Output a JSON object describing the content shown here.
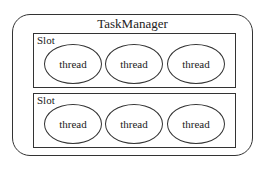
{
  "diagram": {
    "container": {
      "label": "TaskManager",
      "slots": [
        {
          "label": "Slot",
          "threads": [
            {
              "label": "thread"
            },
            {
              "label": "thread"
            },
            {
              "label": "thread"
            }
          ]
        },
        {
          "label": "Slot",
          "threads": [
            {
              "label": "thread"
            },
            {
              "label": "thread"
            },
            {
              "label": "thread"
            }
          ]
        }
      ]
    },
    "colors": {
      "stroke": "#333333",
      "background": "#ffffff",
      "text": "#222222"
    }
  }
}
